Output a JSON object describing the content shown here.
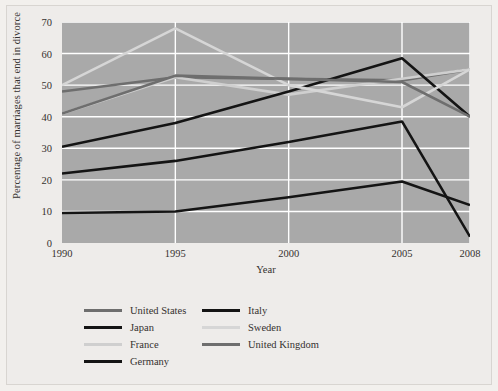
{
  "chart_data": {
    "type": "line",
    "title": "",
    "xlabel": "Year",
    "ylabel": "Percentage of marriages that end in divorce",
    "x": [
      1990,
      1995,
      2000,
      2005,
      2008
    ],
    "xticklabels": [
      "1990",
      "1995",
      "2000",
      "2005",
      "2008"
    ],
    "yticks": [
      0,
      10,
      20,
      30,
      40,
      50,
      60,
      70
    ],
    "yticklabels": [
      "0",
      "10",
      "20",
      "30",
      "40",
      "50",
      "60",
      "70"
    ],
    "xlim": [
      1990,
      2008
    ],
    "ylim": [
      0,
      70
    ],
    "grid": true,
    "legend_position": "below",
    "plot_background": "#a9a9a9",
    "gridline_color": "#ffffff",
    "series": [
      {
        "name": "United States",
        "values": [
          48,
          52.5,
          52,
          51.5,
          55
        ],
        "color": "#6e6e6e"
      },
      {
        "name": "Japan",
        "values": [
          22,
          26,
          32,
          38.5,
          2
        ],
        "color": "#141414"
      },
      {
        "name": "France",
        "values": [
          41,
          52.5,
          47,
          52,
          55
        ],
        "color": "#cfcfcf"
      },
      {
        "name": "Germany",
        "values": [
          30.5,
          38,
          48,
          58.5,
          40
        ],
        "color": "#141414"
      },
      {
        "name": "Italy",
        "values": [
          9.5,
          10,
          14.5,
          19.5,
          12
        ],
        "color": "#141414"
      },
      {
        "name": "Sweden",
        "values": [
          50,
          68,
          50,
          43,
          55
        ],
        "color": "#d6d6d6"
      },
      {
        "name": "United Kingdom",
        "values": [
          41,
          53,
          52,
          51,
          40
        ],
        "color": "#6e6e6e"
      }
    ]
  },
  "legend": {
    "columns": [
      {
        "items": [
          "United States",
          "Japan",
          "France",
          "Germany"
        ]
      },
      {
        "items": [
          "Italy",
          "Sweden",
          "United Kingdom"
        ]
      }
    ]
  },
  "axes": {
    "y_title": "Percentage of marriages that end in divorce",
    "x_title": "Year"
  }
}
